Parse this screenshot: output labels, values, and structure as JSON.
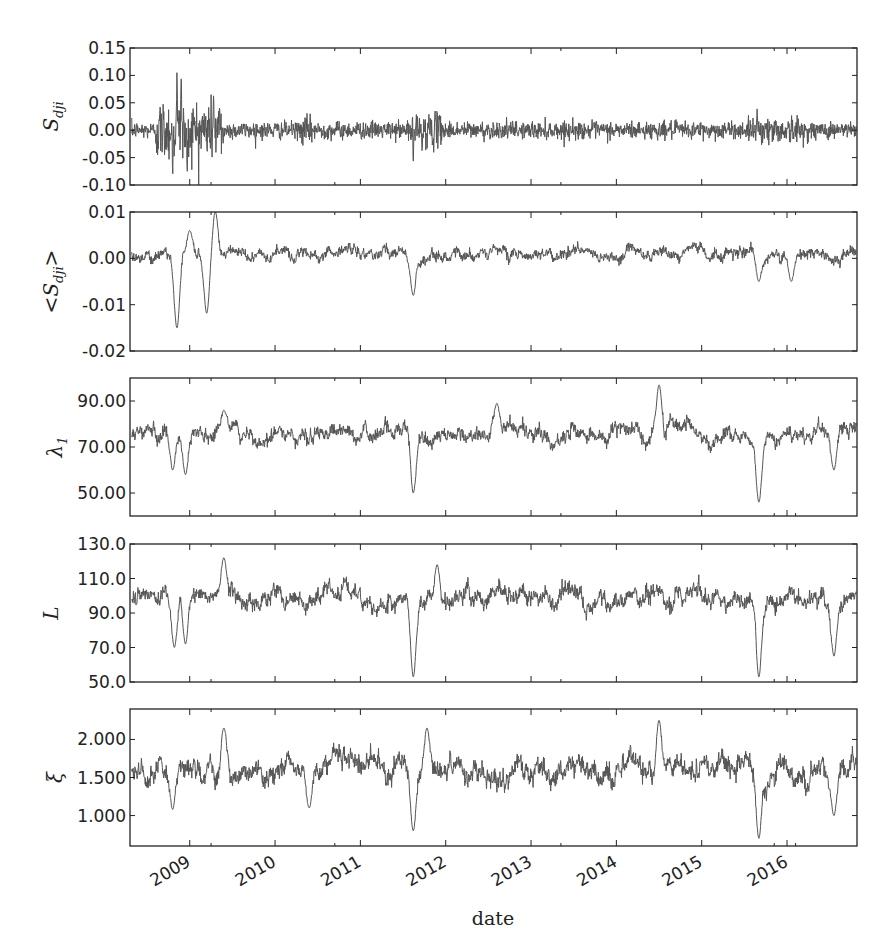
{
  "chart_data": [
    {
      "type": "line",
      "panel": 1,
      "ylabel": "S_dji",
      "ylabel_main": "S",
      "ylabel_sub": "dji",
      "ylim": [
        -0.1,
        0.15
      ],
      "yticks": [
        0.15,
        0.1,
        0.05,
        0.0,
        -0.05,
        -0.1
      ],
      "ytick_labels": [
        "0.15",
        "0.10",
        "0.05",
        "0.00",
        "-0.05",
        "-0.10"
      ],
      "series_profile": {
        "base": 0.0,
        "noise": 0.008,
        "features": [
          {
            "date": 2008.85,
            "value": 0.105,
            "kind": "spike"
          },
          {
            "date": 2008.9,
            "value": 0.103,
            "kind": "spike"
          },
          {
            "date": 2008.8,
            "value": -0.082,
            "kind": "spike"
          },
          {
            "date": 2008.97,
            "value": -0.08,
            "kind": "spike"
          },
          {
            "date": 2009.28,
            "value": 0.065,
            "kind": "spike"
          },
          {
            "date": 2011.62,
            "value": -0.057,
            "kind": "spike"
          },
          {
            "date": 2015.65,
            "value": 0.04,
            "kind": "spike"
          }
        ],
        "volatility": [
          {
            "from": 2008.6,
            "to": 2009.4,
            "scale": 3.5
          },
          {
            "from": 2010.3,
            "to": 2010.5,
            "scale": 1.6
          },
          {
            "from": 2011.55,
            "to": 2011.95,
            "scale": 2.0
          },
          {
            "from": 2015.6,
            "to": 2016.2,
            "scale": 1.5
          }
        ]
      }
    },
    {
      "type": "line",
      "panel": 2,
      "ylabel": "<S_dji>",
      "ylabel_main": "<S",
      "ylabel_sub": "dji",
      "ylabel_tail": ">",
      "ylim": [
        -0.02,
        0.01
      ],
      "yticks": [
        0.01,
        0.0,
        -0.01,
        -0.02
      ],
      "ytick_labels": [
        "0.01",
        "0.00",
        "-0.01",
        "-0.02"
      ],
      "series_profile": {
        "base": 0.001,
        "noise": 0.0012,
        "features": [
          {
            "date": 2008.85,
            "value": -0.015,
            "kind": "dip"
          },
          {
            "date": 2009.0,
            "value": 0.006,
            "kind": "spike"
          },
          {
            "date": 2009.2,
            "value": -0.012,
            "kind": "dip"
          },
          {
            "date": 2009.3,
            "value": 0.01,
            "kind": "spike"
          },
          {
            "date": 2011.62,
            "value": -0.008,
            "kind": "dip"
          },
          {
            "date": 2015.67,
            "value": -0.005,
            "kind": "dip"
          },
          {
            "date": 2016.05,
            "value": -0.005,
            "kind": "dip"
          }
        ]
      }
    },
    {
      "type": "line",
      "panel": 3,
      "ylabel": "λ1",
      "ylabel_main": "λ",
      "ylabel_sub": "1",
      "ylim": [
        40,
        100
      ],
      "yticks": [
        90,
        70,
        50
      ],
      "ytick_labels": [
        "90.00",
        "70.00",
        "50.00"
      ],
      "series_profile": {
        "base": 76,
        "noise": 3.2,
        "features": [
          {
            "date": 2008.8,
            "value": 60,
            "kind": "dip"
          },
          {
            "date": 2008.95,
            "value": 58,
            "kind": "dip"
          },
          {
            "date": 2009.4,
            "value": 86,
            "kind": "spike"
          },
          {
            "date": 2011.62,
            "value": 50,
            "kind": "dip"
          },
          {
            "date": 2012.6,
            "value": 89,
            "kind": "spike"
          },
          {
            "date": 2014.5,
            "value": 97,
            "kind": "spike"
          },
          {
            "date": 2015.67,
            "value": 46,
            "kind": "dip"
          },
          {
            "date": 2016.55,
            "value": 60,
            "kind": "dip"
          }
        ]
      }
    },
    {
      "type": "line",
      "panel": 4,
      "ylabel": "L",
      "ylabel_main": "L",
      "ylim": [
        50,
        130
      ],
      "yticks": [
        130,
        110,
        90,
        70,
        50
      ],
      "ytick_labels": [
        "130.0",
        "110.0",
        "90.0",
        "70.0",
        "50.0"
      ],
      "series_profile": {
        "base": 99,
        "noise": 5,
        "features": [
          {
            "date": 2008.82,
            "value": 70,
            "kind": "dip"
          },
          {
            "date": 2008.95,
            "value": 72,
            "kind": "dip"
          },
          {
            "date": 2009.4,
            "value": 122,
            "kind": "spike"
          },
          {
            "date": 2011.62,
            "value": 53,
            "kind": "dip"
          },
          {
            "date": 2011.9,
            "value": 118,
            "kind": "spike"
          },
          {
            "date": 2015.67,
            "value": 53,
            "kind": "dip"
          },
          {
            "date": 2016.55,
            "value": 65,
            "kind": "dip"
          }
        ]
      }
    },
    {
      "type": "line",
      "panel": 5,
      "ylabel": "ξ",
      "ylabel_main": "ξ",
      "ylim": [
        0.6,
        2.4
      ],
      "yticks": [
        2.0,
        1.5,
        1.0
      ],
      "ytick_labels": [
        "2.000",
        "1.500",
        "1.000"
      ],
      "series_profile": {
        "base": 1.62,
        "noise": 0.14,
        "features": [
          {
            "date": 2008.8,
            "value": 1.08,
            "kind": "dip"
          },
          {
            "date": 2009.4,
            "value": 2.15,
            "kind": "spike"
          },
          {
            "date": 2010.4,
            "value": 1.1,
            "kind": "dip"
          },
          {
            "date": 2011.62,
            "value": 0.8,
            "kind": "dip"
          },
          {
            "date": 2011.78,
            "value": 2.15,
            "kind": "spike"
          },
          {
            "date": 2014.5,
            "value": 2.25,
            "kind": "spike"
          },
          {
            "date": 2015.67,
            "value": 0.7,
            "kind": "dip"
          },
          {
            "date": 2016.55,
            "value": 1.0,
            "kind": "dip"
          }
        ]
      }
    }
  ],
  "x_axis": {
    "label": "date",
    "range": [
      2008.3,
      2016.82
    ],
    "major_ticks": [
      2009,
      2010,
      2011,
      2012,
      2013,
      2014,
      2015,
      2016
    ],
    "major_tick_labels": [
      "2009",
      "2010",
      "2011",
      "2012",
      "2013",
      "2014",
      "2015",
      "2016"
    ],
    "minor_ticks": [
      2009.25,
      2010.7,
      2013.35,
      2015.85,
      2016.1
    ]
  },
  "style": {
    "line_color": "#555555",
    "axis_color": "#222222",
    "background": "#ffffff"
  }
}
